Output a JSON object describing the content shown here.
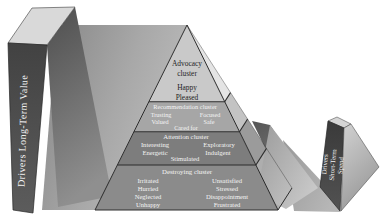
{
  "diagram": {
    "left_driver": {
      "lines": [
        "Drivers Long-Term Value"
      ]
    },
    "right_driver": {
      "lines": [
        "Drivers",
        "Short-Term",
        "Spend"
      ]
    },
    "pyramid": {
      "clusters": [
        {
          "name_lines": [
            "Advocacy",
            "cluster"
          ],
          "emotions": [
            "Happy",
            "Pleased"
          ]
        },
        {
          "name": "Recommendation cluster",
          "emotions": [
            "Trusting",
            "Valued",
            "Focused",
            "Safe",
            "Cared for"
          ]
        },
        {
          "name": "Attention cluster",
          "emotions": [
            "Interesting",
            "Energetic",
            "Stimulated",
            "Exploratory",
            "Indulgent"
          ]
        },
        {
          "name": "Destroying cluster",
          "emotions": [
            "Irritated",
            "Hurried",
            "Neglected",
            "Unhappy",
            "Unsatisfied",
            "Stressed",
            "Disappointment",
            "Frustrated"
          ]
        }
      ]
    },
    "colors": {
      "band_advocacy_front": "#c9c9c9",
      "band_recommendation_front": "#a6a6a6",
      "band_attention_front": "#7d7d7d",
      "band_destroying_front": "#8b8b8b",
      "band_advocacy_side": "#e4e4e4",
      "band_recommendation_side": "#c3c3c3",
      "band_attention_side": "#9b9b9b",
      "band_destroying_side": "#aeaeae",
      "driver_bar_face": "#454545",
      "slab_top_face": "#d9d9d9",
      "edge_line": "#2c2c2c",
      "text_light": "#f4f4f4",
      "text_dark": "#1f1f1f"
    }
  }
}
